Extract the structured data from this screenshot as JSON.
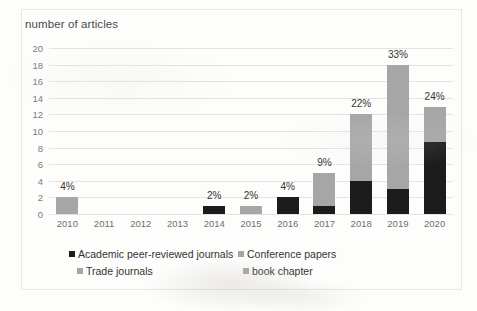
{
  "chart_data": {
    "type": "bar",
    "subtype": "stacked-bar",
    "title": "number of articles",
    "xlabel": "",
    "ylabel": "number of articles",
    "ylim": [
      0,
      20
    ],
    "ytick_step": 2,
    "yticks": [
      "20",
      "18",
      "16",
      "14",
      "12",
      "10",
      "8",
      "6",
      "4",
      "2",
      "0"
    ],
    "grid": true,
    "legend_position": "bottom",
    "categories": [
      "2010",
      "2011",
      "2012",
      "2013",
      "2014",
      "2015",
      "2016",
      "2017",
      "2018",
      "2019",
      "2020"
    ],
    "series": [
      {
        "name": "Academic peer-reviewed journals",
        "color": "#1c1c1c",
        "values": [
          0,
          0,
          0,
          0,
          1,
          0,
          2,
          1,
          4,
          3,
          8.7
        ]
      },
      {
        "name": "Conference papers",
        "color": "#a6a6a6",
        "values": [
          2,
          0,
          0,
          0,
          0,
          1,
          0,
          4,
          8,
          15,
          4.2
        ]
      },
      {
        "name": "Trade journals",
        "color": "#a6a6a6",
        "values": [
          0,
          0,
          0,
          0,
          0,
          0,
          0,
          0,
          0,
          0,
          0
        ]
      },
      {
        "name": "book chapter",
        "color": "#a6a6a6",
        "values": [
          0,
          0,
          0,
          0,
          0,
          0,
          0,
          0,
          0,
          0,
          0
        ]
      }
    ],
    "totals": [
      2,
      0,
      0,
      0,
      1,
      1,
      2,
      5,
      12,
      18,
      12.9
    ],
    "data_labels": [
      "4%",
      "",
      "",
      "",
      "2%",
      "2%",
      "4%",
      "9%",
      "22%",
      "33%",
      "24%"
    ],
    "legend": [
      {
        "label": "Academic peer-reviewed journals",
        "color": "#1c1c1c"
      },
      {
        "label": "Conference papers",
        "color": "#a6a6a6"
      },
      {
        "label": "Trade journals",
        "color": "#a6a6a6"
      },
      {
        "label": "book chapter",
        "color": "#a6a6a6"
      }
    ]
  }
}
